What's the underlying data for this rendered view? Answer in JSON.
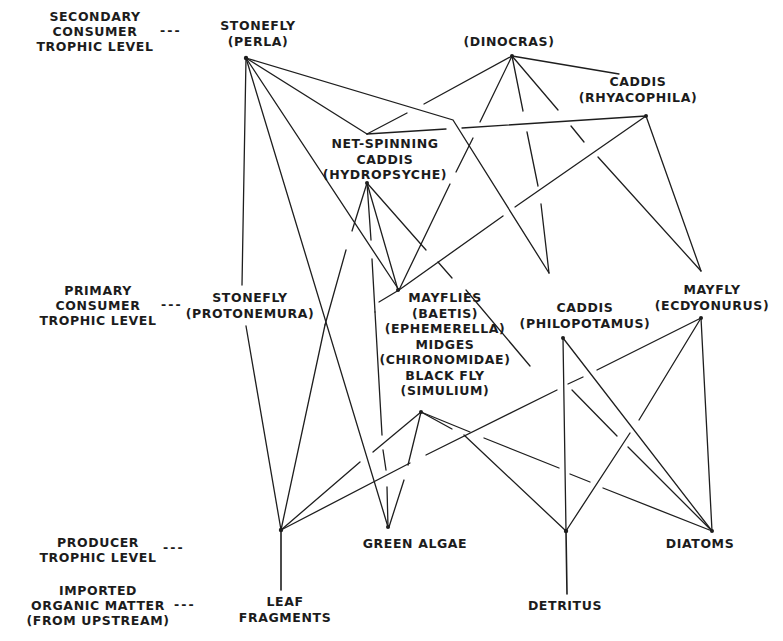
{
  "diagram": {
    "type": "food-web",
    "levels": [
      {
        "id": "secondary",
        "label": "SECONDARY\nCONSUMER\nTROPHIC LEVEL",
        "connector": "---"
      },
      {
        "id": "primary",
        "label": "PRIMARY\nCONSUMER\nTROPHIC LEVEL",
        "connector": "---"
      },
      {
        "id": "producer",
        "label": "PRODUCER\nTROPHIC LEVEL",
        "connector": "---"
      },
      {
        "id": "imported",
        "label": "IMPORTED\nORGANIC MATTER\n(FROM UPSTREAM)",
        "connector": "---"
      }
    ],
    "nodes": {
      "perla": {
        "label": "STONEFLY\n(PERLA)",
        "level": "secondary"
      },
      "dinocras": {
        "label": "(DINOCRAS)",
        "level": "secondary"
      },
      "rhyacophila": {
        "label": "CADDIS\n(RHYACOPHILA)",
        "level": "secondary"
      },
      "hydropsyche": {
        "label": "NET-SPINNING\nCADDIS\n(HYDROPSYCHE)",
        "level": "secondary"
      },
      "protonemura": {
        "label": "STONEFLY\n(PROTONEMURA)",
        "level": "primary"
      },
      "mayflies": {
        "label": "MAYFLIES\n(BAETIS)\n(EPHEMERELLA)\nMIDGES\n(CHIRONOMIDAE)\nBLACK FLY\n(SIMULIUM)",
        "level": "primary"
      },
      "philopotamus": {
        "label": "CADDIS\n(PHILOPOTAMUS)",
        "level": "primary"
      },
      "ecdyonurus": {
        "label": "MAYFLY\n(ECDYONURUS)",
        "level": "primary"
      },
      "green_algae": {
        "label": "GREEN ALGAE",
        "level": "producer"
      },
      "diatoms": {
        "label": "DIATOMS",
        "level": "producer"
      },
      "leaf_fragments": {
        "label": "LEAF\nFRAGMENTS",
        "level": "imported"
      },
      "detritus": {
        "label": "DETRITUS",
        "level": "imported"
      }
    },
    "edges": [
      [
        "perla",
        "protonemura"
      ],
      [
        "perla",
        "green_algae"
      ],
      [
        "perla",
        "mayflies"
      ],
      [
        "perla",
        "hydropsyche"
      ],
      [
        "perla",
        "philopotamus"
      ],
      [
        "dinocras",
        "hydropsyche"
      ],
      [
        "dinocras",
        "mayflies"
      ],
      [
        "dinocras",
        "philopotamus"
      ],
      [
        "dinocras",
        "ecdyonurus"
      ],
      [
        "dinocras",
        "rhyacophila"
      ],
      [
        "rhyacophila",
        "hydropsyche"
      ],
      [
        "rhyacophila",
        "mayflies"
      ],
      [
        "rhyacophila",
        "ecdyonurus"
      ],
      [
        "hydropsyche",
        "mayflies"
      ],
      [
        "hydropsyche",
        "green_algae"
      ],
      [
        "hydropsyche",
        "diatoms"
      ],
      [
        "hydropsyche",
        "leaf_fragments"
      ],
      [
        "protonemura",
        "leaf_fragments"
      ],
      [
        "mayflies",
        "leaf_fragments"
      ],
      [
        "mayflies",
        "green_algae"
      ],
      [
        "mayflies",
        "detritus"
      ],
      [
        "mayflies",
        "diatoms"
      ],
      [
        "philopotamus",
        "detritus"
      ],
      [
        "philopotamus",
        "diatoms"
      ],
      [
        "ecdyonurus",
        "leaf_fragments"
      ],
      [
        "ecdyonurus",
        "detritus"
      ],
      [
        "ecdyonurus",
        "diatoms"
      ],
      [
        "leaf_fragments",
        "leaf_fragments_label"
      ],
      [
        "detritus",
        "detritus_label"
      ]
    ]
  }
}
